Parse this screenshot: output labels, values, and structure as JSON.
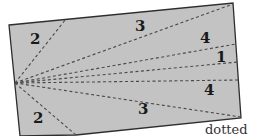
{
  "diagram": {
    "colors": {
      "fill": "#c3c3c3",
      "border": "#2e2e2e",
      "dash": "#4a4a4a",
      "label": "#1a1a1a"
    },
    "rectangle": {
      "polygon": "9,25 233,3 241,118 76,135 20,136"
    },
    "apex": {
      "x": 15,
      "y": 83
    },
    "rays": [
      {
        "to_x": 66,
        "to_y": 19
      },
      {
        "to_x": 233,
        "to_y": 4
      },
      {
        "to_x": 236,
        "to_y": 44
      },
      {
        "to_x": 238,
        "to_y": 62
      },
      {
        "to_x": 239,
        "to_y": 80
      },
      {
        "to_x": 241,
        "to_y": 117
      },
      {
        "to_x": 76,
        "to_y": 135
      }
    ],
    "labels": [
      {
        "text": "2",
        "x": 30,
        "y": 44
      },
      {
        "text": "3",
        "x": 135,
        "y": 31
      },
      {
        "text": "4",
        "x": 200,
        "y": 43
      },
      {
        "text": "1",
        "x": 216,
        "y": 62
      },
      {
        "text": "4",
        "x": 204,
        "y": 95
      },
      {
        "text": "3",
        "x": 138,
        "y": 114
      },
      {
        "text": "2",
        "x": 33,
        "y": 123
      }
    ],
    "caption_fragment": "dotted"
  }
}
